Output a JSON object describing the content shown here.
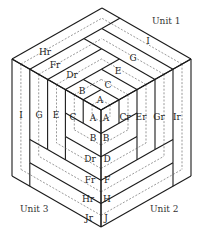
{
  "diagram": {
    "type": "log-cabin-tumbling-block",
    "units": [
      {
        "name": "Unit 1",
        "face": "top",
        "label_pos": [
          152,
          24
        ]
      },
      {
        "name": "Unit 2",
        "face": "right",
        "label_pos": [
          150,
          212
        ]
      },
      {
        "name": "Unit 3",
        "face": "left",
        "label_pos": [
          20,
          212
        ]
      }
    ],
    "geometry": {
      "center": [
        101,
        110
      ],
      "top": [
        101,
        10
      ],
      "upper_left": [
        12,
        59
      ],
      "upper_right": [
        191,
        59
      ],
      "lower_left": [
        12,
        177
      ],
      "lower_right": [
        191,
        177
      ],
      "bottom": [
        101,
        227
      ],
      "levels": 5
    },
    "top_face_labels": [
      {
        "text": "A",
        "x": 100,
        "y": 103
      },
      {
        "text": "B",
        "x": 82,
        "y": 94
      },
      {
        "text": "C",
        "x": 108,
        "y": 88
      },
      {
        "text": "Dr",
        "x": 72,
        "y": 78
      },
      {
        "text": "E",
        "x": 118,
        "y": 74
      },
      {
        "text": "Fr",
        "x": 55,
        "y": 68
      },
      {
        "text": "G",
        "x": 133,
        "y": 61
      },
      {
        "text": "Hr",
        "x": 45,
        "y": 55
      },
      {
        "text": "I",
        "x": 148,
        "y": 44
      }
    ],
    "left_face_labels": [
      {
        "text": "A",
        "x": 93,
        "y": 121
      },
      {
        "text": "B",
        "x": 93,
        "y": 141
      },
      {
        "text": "C",
        "x": 73,
        "y": 120
      },
      {
        "text": "Dr",
        "x": 90,
        "y": 162
      },
      {
        "text": "E",
        "x": 56,
        "y": 118
      },
      {
        "text": "Fr",
        "x": 90,
        "y": 183
      },
      {
        "text": "G",
        "x": 39,
        "y": 118
      },
      {
        "text": "Hr",
        "x": 88,
        "y": 202
      },
      {
        "text": "I",
        "x": 21,
        "y": 118
      },
      {
        "text": "Jr",
        "x": 89,
        "y": 221
      }
    ],
    "right_face_labels": [
      {
        "text": "A",
        "x": 106,
        "y": 121
      },
      {
        "text": "B",
        "x": 106,
        "y": 141
      },
      {
        "text": "Cr",
        "x": 125,
        "y": 120
      },
      {
        "text": "D",
        "x": 107,
        "y": 162
      },
      {
        "text": "Er",
        "x": 141,
        "y": 120
      },
      {
        "text": "F",
        "x": 107,
        "y": 183
      },
      {
        "text": "Gr",
        "x": 159,
        "y": 120
      },
      {
        "text": "H",
        "x": 107,
        "y": 202
      },
      {
        "text": "Ir",
        "x": 177,
        "y": 120
      },
      {
        "text": "J",
        "x": 106,
        "y": 221
      }
    ]
  }
}
